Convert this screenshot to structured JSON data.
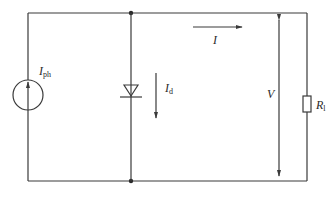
{
  "diagram": {
    "type": "equivalent-circuit",
    "components": {
      "current_source": {
        "label": "I",
        "subscript": "ph"
      },
      "diode": {
        "current_label": "I",
        "current_subscript": "d"
      },
      "load_current": {
        "label": "I"
      },
      "voltage": {
        "label": "V"
      },
      "resistor": {
        "label": "R",
        "subscript": "l"
      }
    },
    "colors": {
      "line": "#3a3a3a",
      "text": "#2a2a2a",
      "background": "#ffffff"
    }
  }
}
